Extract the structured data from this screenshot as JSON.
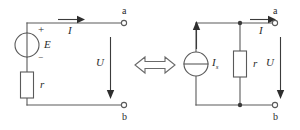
{
  "figure": {
    "width": 300,
    "height": 130,
    "background_color": "#ffffff",
    "line_color": "#5a5a5a",
    "text_color": "#2b2b2b"
  },
  "left_circuit": {
    "name": "practical-voltage-source",
    "description": "Ideal EMF source E in series with internal resistance r, feeding terminals a-b",
    "source": {
      "type": "voltage-source",
      "symbol": "circle-with-vertical-lead",
      "label": "E",
      "plus_sign": "+",
      "minus_sign": "−"
    },
    "resistor": {
      "type": "resistor",
      "orientation": "vertical",
      "label": "r"
    },
    "current": {
      "label": "I",
      "direction": "right",
      "position": "top-branch"
    },
    "voltage": {
      "label": "U",
      "direction": "down",
      "position": "across-terminals"
    },
    "terminals": [
      {
        "label": "a",
        "position": "top-right"
      },
      {
        "label": "b",
        "position": "bottom-right"
      }
    ]
  },
  "equivalence": {
    "name": "equivalence-symbol",
    "glyph": "⟺",
    "description": "double-headed hollow arrow indicating the two circuits are equivalent"
  },
  "right_circuit": {
    "name": "practical-current-source",
    "description": "Ideal current source Is in parallel with resistance r, feeding terminals a-b",
    "source": {
      "type": "current-source",
      "symbol": "circle-with-horizontal-bar",
      "label": "I",
      "label_subscript": "s",
      "arrow_direction": "up",
      "arrow_label": ""
    },
    "resistor": {
      "type": "resistor",
      "orientation": "vertical",
      "label": "r"
    },
    "current": {
      "label": "I",
      "direction": "right",
      "position": "top-branch"
    },
    "voltage": {
      "label": "U",
      "direction": "down",
      "position": "across-terminals"
    },
    "terminals": [
      {
        "label": "a",
        "position": "top-right"
      },
      {
        "label": "b",
        "position": "bottom-right"
      }
    ],
    "junctions": 2
  }
}
